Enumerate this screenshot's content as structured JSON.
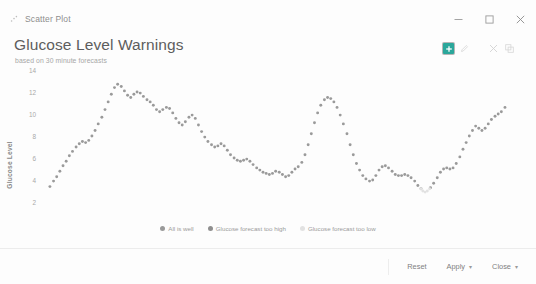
{
  "window": {
    "app_icon": "scatter-plot-icon",
    "title": "Scatter Plot",
    "minimize_label": "—",
    "maximize_label": "□",
    "close_label": "✕"
  },
  "header": {
    "title": "Glucose Level Warnings",
    "subtitle": "based on 30 minute forecasts",
    "tools": [
      {
        "name": "add-icon",
        "glyph": "⊕",
        "active": true
      },
      {
        "name": "edit-icon",
        "glyph": "✎",
        "active": false
      },
      {
        "name": "settings-icon",
        "glyph": "✕",
        "active": false
      },
      {
        "name": "expand-icon",
        "glyph": "⧉",
        "active": false
      }
    ]
  },
  "legend": {
    "items": [
      {
        "label": "All is well",
        "color": "#9a9a9a"
      },
      {
        "label": "Glucose forecast too high",
        "color": "#8f8f8f"
      },
      {
        "label": "Glucose forecast too low",
        "color": "#e2e2e2"
      }
    ]
  },
  "footer": {
    "buttons": [
      {
        "name": "reset-button",
        "label": "Reset",
        "caret": ""
      },
      {
        "name": "apply-button",
        "label": "Apply",
        "caret": "▾"
      },
      {
        "name": "close-button",
        "label": "Close",
        "caret": "▾"
      }
    ]
  },
  "chart_data": {
    "type": "scatter",
    "title": "Glucose Level Warnings",
    "subtitle": "based on 30 minute forecasts",
    "xlabel": "Time Stamp",
    "ylabel": "Glucose Level",
    "grid": false,
    "legend_position": "bottom",
    "ylim": [
      2,
      14
    ],
    "yticks": [
      14,
      12,
      10,
      8,
      6,
      4,
      2
    ],
    "xtick_labels": [
      "2014-10-05",
      "2014-10-06",
      "2014-10-06",
      "2014-10-06"
    ],
    "xtick_positions": [
      0.06,
      0.34,
      0.61,
      0.81
    ],
    "series": [
      {
        "name": "All is well",
        "color": "#9a9a9a",
        "points": [
          [
            0.052,
            3.4
          ],
          [
            0.06,
            3.9
          ],
          [
            0.067,
            4.3
          ],
          [
            0.074,
            4.8
          ],
          [
            0.081,
            5.3
          ],
          [
            0.088,
            5.7
          ],
          [
            0.095,
            6.2
          ],
          [
            0.102,
            6.6
          ],
          [
            0.11,
            7.0
          ],
          [
            0.117,
            7.3
          ],
          [
            0.124,
            7.5
          ],
          [
            0.131,
            7.4
          ],
          [
            0.138,
            7.6
          ],
          [
            0.145,
            8.0
          ],
          [
            0.152,
            8.5
          ],
          [
            0.159,
            9.1
          ],
          [
            0.167,
            9.7
          ],
          [
            0.174,
            10.4
          ],
          [
            0.181,
            11.1
          ],
          [
            0.188,
            11.8
          ],
          [
            0.195,
            12.4
          ],
          [
            0.202,
            12.7
          ],
          [
            0.21,
            12.5
          ],
          [
            0.217,
            12.1
          ],
          [
            0.224,
            11.7
          ],
          [
            0.231,
            11.5
          ],
          [
            0.238,
            11.8
          ],
          [
            0.245,
            12.0
          ],
          [
            0.252,
            11.9
          ],
          [
            0.259,
            11.6
          ],
          [
            0.267,
            11.3
          ],
          [
            0.274,
            11.1
          ],
          [
            0.281,
            10.8
          ],
          [
            0.288,
            10.4
          ],
          [
            0.295,
            10.2
          ],
          [
            0.302,
            10.4
          ],
          [
            0.31,
            10.6
          ],
          [
            0.317,
            10.5
          ],
          [
            0.324,
            10.1
          ],
          [
            0.331,
            9.6
          ],
          [
            0.338,
            9.2
          ],
          [
            0.345,
            9.0
          ],
          [
            0.352,
            9.3
          ],
          [
            0.36,
            9.7
          ],
          [
            0.367,
            9.9
          ],
          [
            0.374,
            9.6
          ],
          [
            0.381,
            9.0
          ],
          [
            0.388,
            8.4
          ],
          [
            0.395,
            7.9
          ],
          [
            0.402,
            7.5
          ],
          [
            0.41,
            7.2
          ],
          [
            0.417,
            7.0
          ],
          [
            0.424,
            7.1
          ],
          [
            0.431,
            7.3
          ],
          [
            0.438,
            7.1
          ],
          [
            0.445,
            6.7
          ],
          [
            0.452,
            6.3
          ],
          [
            0.46,
            6.0
          ],
          [
            0.467,
            5.8
          ],
          [
            0.474,
            5.7
          ],
          [
            0.481,
            5.8
          ],
          [
            0.488,
            5.9
          ],
          [
            0.495,
            5.7
          ],
          [
            0.502,
            5.4
          ],
          [
            0.51,
            5.1
          ],
          [
            0.517,
            4.9
          ],
          [
            0.524,
            4.7
          ],
          [
            0.531,
            4.6
          ],
          [
            0.538,
            4.5
          ],
          [
            0.545,
            4.6
          ],
          [
            0.552,
            4.8
          ],
          [
            0.56,
            4.7
          ],
          [
            0.567,
            4.5
          ],
          [
            0.574,
            4.3
          ],
          [
            0.581,
            4.4
          ],
          [
            0.588,
            4.7
          ],
          [
            0.595,
            5.0
          ],
          [
            0.602,
            5.2
          ],
          [
            0.61,
            5.6
          ],
          [
            0.617,
            6.3
          ],
          [
            0.624,
            7.2
          ],
          [
            0.631,
            8.2
          ],
          [
            0.638,
            9.2
          ],
          [
            0.645,
            10.1
          ],
          [
            0.652,
            10.8
          ],
          [
            0.66,
            11.3
          ],
          [
            0.667,
            11.5
          ],
          [
            0.674,
            11.4
          ],
          [
            0.681,
            11.1
          ],
          [
            0.688,
            10.6
          ],
          [
            0.695,
            9.9
          ],
          [
            0.702,
            9.1
          ],
          [
            0.71,
            8.2
          ],
          [
            0.717,
            7.2
          ],
          [
            0.724,
            6.3
          ],
          [
            0.731,
            5.5
          ],
          [
            0.738,
            4.9
          ],
          [
            0.745,
            4.4
          ],
          [
            0.752,
            4.1
          ],
          [
            0.76,
            3.9
          ],
          [
            0.767,
            4.0
          ],
          [
            0.774,
            4.4
          ],
          [
            0.781,
            4.9
          ],
          [
            0.788,
            5.2
          ],
          [
            0.795,
            5.3
          ],
          [
            0.802,
            5.1
          ],
          [
            0.81,
            4.8
          ],
          [
            0.817,
            4.5
          ],
          [
            0.824,
            4.4
          ],
          [
            0.831,
            4.4
          ],
          [
            0.838,
            4.5
          ],
          [
            0.845,
            4.4
          ],
          [
            0.852,
            4.2
          ],
          [
            0.86,
            3.9
          ],
          [
            0.867,
            3.5
          ],
          [
            0.874,
            3.2
          ],
          [
            0.895,
            3.3
          ],
          [
            0.902,
            3.7
          ],
          [
            0.91,
            4.2
          ],
          [
            0.917,
            4.7
          ],
          [
            0.924,
            5.0
          ],
          [
            0.931,
            5.1
          ],
          [
            0.938,
            5.0
          ],
          [
            0.945,
            5.1
          ],
          [
            0.952,
            5.5
          ],
          [
            0.96,
            6.1
          ],
          [
            0.967,
            6.8
          ],
          [
            0.974,
            7.4
          ],
          [
            0.981,
            8.0
          ],
          [
            0.988,
            8.5
          ],
          [
            0.995,
            8.9
          ],
          [
            1.002,
            8.7
          ],
          [
            1.009,
            8.5
          ],
          [
            1.016,
            8.7
          ],
          [
            1.023,
            9.1
          ],
          [
            1.03,
            9.5
          ],
          [
            1.038,
            9.8
          ],
          [
            1.045,
            10.0
          ],
          [
            1.052,
            10.2
          ],
          [
            1.06,
            10.6
          ]
        ]
      },
      {
        "name": "Glucose forecast too high",
        "color": "#8f8f8f",
        "points": []
      },
      {
        "name": "Glucose forecast too low",
        "color": "#e2e2e2",
        "points": [
          [
            0.874,
            3.2
          ],
          [
            0.878,
            3.0
          ],
          [
            0.883,
            2.9
          ],
          [
            0.888,
            3.0
          ],
          [
            0.893,
            3.2
          ]
        ]
      }
    ]
  }
}
